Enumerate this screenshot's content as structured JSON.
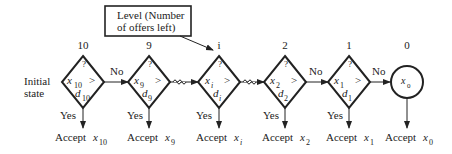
{
  "callout": {
    "line1": "Level  (Number",
    "line2": "of offers left)"
  },
  "initial_state": {
    "line1": "Initial",
    "line2": "state"
  },
  "edge_label_no": "No",
  "edge_label_yes": "Yes",
  "question_mark": "?",
  "comparison": ">",
  "nodes": [
    {
      "level": "10",
      "x_sub": "10",
      "d_sub": "10",
      "accept": "Accept",
      "accept_sub": "10"
    },
    {
      "level": "9",
      "x_sub": "9",
      "d_sub": "9",
      "accept": "Accept",
      "accept_sub": "9"
    },
    {
      "level": "i",
      "x_sub": "i",
      "d_sub": "i",
      "accept": "Accept",
      "accept_sub": "i"
    },
    {
      "level": "2",
      "x_sub": "2",
      "d_sub": "2",
      "accept": "Accept",
      "accept_sub": "2"
    },
    {
      "level": "1",
      "x_sub": "1",
      "d_sub": "1",
      "accept": "Accept",
      "accept_sub": "1"
    }
  ],
  "terminal": {
    "level": "0",
    "x_sub": "0",
    "accept": "Accept",
    "accept_sub": "0"
  },
  "var_x": "x",
  "var_d": "d",
  "break_symbol": "~~"
}
